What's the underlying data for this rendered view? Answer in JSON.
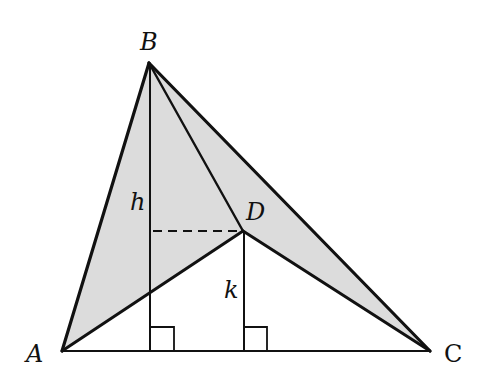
{
  "diagram": {
    "type": "geometry",
    "colors": {
      "shade": "#dcdcdc",
      "stroke": "#111111",
      "background": "#ffffff"
    },
    "points": {
      "A": {
        "label": "A",
        "x": 62,
        "y": 351
      },
      "B": {
        "label": "B",
        "x": 149,
        "y": 63
      },
      "C": {
        "label": "C",
        "x": 430,
        "y": 351
      },
      "D": {
        "label": "D",
        "x": 243,
        "y": 231
      }
    },
    "labels": {
      "A": "A",
      "B": "B",
      "C": "C",
      "D": "D",
      "h": "h",
      "k": "k"
    },
    "segments": [
      "AB",
      "BC",
      "CA",
      "AD",
      "DC",
      "BD"
    ],
    "altitudes": [
      {
        "name": "h",
        "from": "B",
        "foot_x": 151
      },
      {
        "name": "k",
        "from": "D",
        "foot_x": 244
      }
    ],
    "dashed": {
      "from_x": 151,
      "to": "D",
      "y": 231
    }
  }
}
